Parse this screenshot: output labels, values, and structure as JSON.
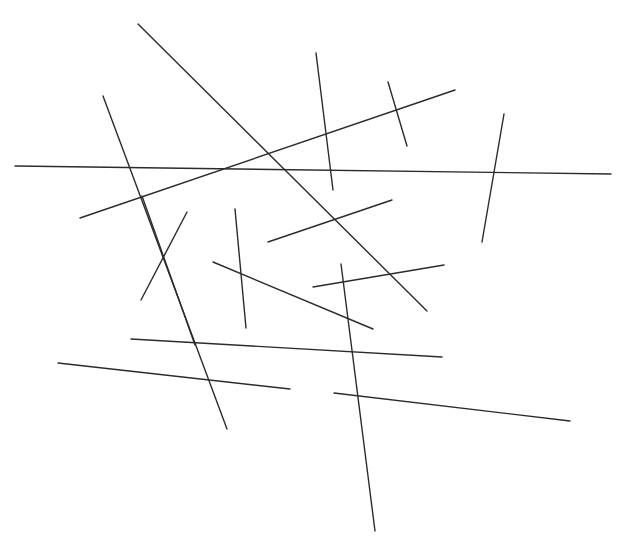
{
  "figure": {
    "width": 628,
    "height": 555,
    "background_color": "#ffffff",
    "stroke_color": "#2b2b2b",
    "stroke_width": 1.4,
    "segment_count": 16
  },
  "chart_data": {
    "type": "scatter",
    "title": "",
    "subtitle": "",
    "xlabel": "",
    "ylabel": "",
    "xlim": [
      0,
      628
    ],
    "ylim": [
      0,
      555
    ],
    "grid": false,
    "legend": "none",
    "annotations": [],
    "tick_labels": {
      "x": [],
      "y": []
    },
    "series": [
      {
        "name": "line-segments",
        "geometry": "segments",
        "values": [
          {
            "id": "seg-01",
            "x1": 138,
            "y1": 24,
            "x2": 427,
            "y2": 311,
            "orientation": "diagonal-down-right",
            "length": 409
          },
          {
            "id": "seg-02",
            "x1": 103,
            "y1": 96,
            "x2": 227,
            "y2": 429,
            "orientation": "steep-down-right",
            "length": 355
          },
          {
            "id": "seg-03",
            "x1": 15,
            "y1": 166,
            "x2": 611,
            "y2": 174,
            "orientation": "horizontal",
            "length": 596
          },
          {
            "id": "seg-04",
            "x1": 80,
            "y1": 218,
            "x2": 455,
            "y2": 90,
            "orientation": "shallow-up-right",
            "length": 396
          },
          {
            "id": "seg-05",
            "x1": 316,
            "y1": 53,
            "x2": 333,
            "y2": 190,
            "orientation": "near-vertical",
            "length": 138
          },
          {
            "id": "seg-06",
            "x1": 388,
            "y1": 82,
            "x2": 407,
            "y2": 146,
            "orientation": "near-vertical-short",
            "length": 67
          },
          {
            "id": "seg-07",
            "x1": 504,
            "y1": 114,
            "x2": 482,
            "y2": 242,
            "orientation": "near-vertical",
            "length": 130
          },
          {
            "id": "seg-08",
            "x1": 187,
            "y1": 212,
            "x2": 141,
            "y2": 300,
            "orientation": "steep-down-left",
            "length": 99
          },
          {
            "id": "seg-09",
            "x1": 142,
            "y1": 196,
            "x2": 195,
            "y2": 345,
            "orientation": "steep-down-right",
            "length": 158
          },
          {
            "id": "seg-10",
            "x1": 235,
            "y1": 209,
            "x2": 246,
            "y2": 328,
            "orientation": "near-vertical",
            "length": 120
          },
          {
            "id": "seg-11",
            "x1": 268,
            "y1": 242,
            "x2": 392,
            "y2": 200,
            "orientation": "shallow-up-right",
            "length": 131
          },
          {
            "id": "seg-12",
            "x1": 213,
            "y1": 262,
            "x2": 373,
            "y2": 329,
            "orientation": "shallow-down-right",
            "length": 173
          },
          {
            "id": "seg-13",
            "x1": 313,
            "y1": 287,
            "x2": 444,
            "y2": 265,
            "orientation": "shallow-up-right",
            "length": 133
          },
          {
            "id": "seg-14",
            "x1": 341,
            "y1": 264,
            "x2": 375,
            "y2": 531,
            "orientation": "near-vertical-long",
            "length": 269
          },
          {
            "id": "seg-15",
            "x1": 131,
            "y1": 339,
            "x2": 442,
            "y2": 357,
            "orientation": "near-horizontal",
            "length": 312
          },
          {
            "id": "seg-16",
            "x1": 58,
            "y1": 363,
            "x2": 290,
            "y2": 389,
            "orientation": "near-horizontal",
            "length": 233
          },
          {
            "id": "seg-17",
            "x1": 334,
            "y1": 393,
            "x2": 570,
            "y2": 421,
            "orientation": "near-horizontal",
            "length": 238
          }
        ]
      }
    ]
  }
}
